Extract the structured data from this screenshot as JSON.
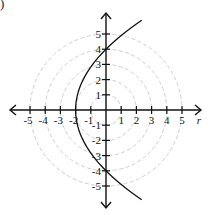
{
  "corner_mark": ")",
  "chart_data": {
    "type": "line",
    "title": "",
    "coordinate_system": "polar",
    "xlabel": "r",
    "ylabel": "",
    "xlim": [
      -5.9,
      6.2
    ],
    "ylim": [
      -6.3,
      6.4
    ],
    "x_ticks": [
      -5,
      -4,
      -3,
      -2,
      -1,
      1,
      2,
      3,
      4,
      5
    ],
    "y_ticks": [
      5,
      4,
      3,
      2,
      1,
      -1,
      -2,
      -3,
      -4,
      -5
    ],
    "x_tick_labels": [
      "-5",
      "-4",
      "-3",
      "-2",
      "-1",
      "1",
      "2",
      "3",
      "4",
      "5"
    ],
    "y_tick_labels": [
      "5",
      "4",
      "3",
      "2",
      "1",
      "-1",
      "-2",
      "-3",
      "-4",
      "-5"
    ],
    "polar_grid_circles": [
      1,
      2,
      3,
      4,
      5
    ],
    "grid": true,
    "legend": null,
    "series": [
      {
        "name": "parabola",
        "equation": "r = 4/(1 - cos θ)",
        "cartesian": "y^2 = 8(x + 2)",
        "vertex": [
          -2,
          0
        ],
        "points": [
          [
            2.35,
            5.9
          ],
          [
            1.13,
            5.0
          ],
          [
            0,
            4
          ],
          [
            -0.88,
            3
          ],
          [
            -1.5,
            2
          ],
          [
            -1.88,
            1
          ],
          [
            -2,
            0
          ],
          [
            -1.88,
            -1
          ],
          [
            -1.5,
            -2
          ],
          [
            -0.88,
            -3
          ],
          [
            0,
            -4
          ],
          [
            1.13,
            -5
          ],
          [
            2.35,
            -5.9
          ]
        ]
      }
    ],
    "colors": {
      "axis": "#111111",
      "curve": "#111111",
      "grid": "#c8c8c8"
    }
  }
}
